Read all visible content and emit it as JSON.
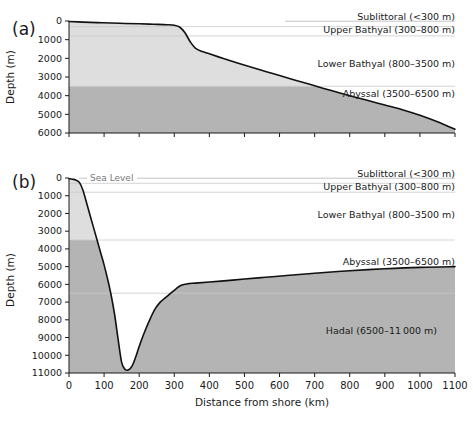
{
  "figure": {
    "axis_titles": {
      "y": "Depth (m)",
      "x": "Distance from shore (km)"
    },
    "sea_level_label": "Sea Level",
    "zones": [
      {
        "name": "sublittoral",
        "label": "Sublittoral (<300 m)",
        "top_m": 0,
        "bottom_m": 300
      },
      {
        "name": "upper-bathyal",
        "label": "Upper Bathyal (300–800 m)",
        "top_m": 300,
        "bottom_m": 800
      },
      {
        "name": "lower-bathyal",
        "label": "Lower Bathyal (800–3500 m)",
        "top_m": 800,
        "bottom_m": 3500
      },
      {
        "name": "abyssal",
        "label": "Abyssal (3500–6500 m)",
        "top_m": 3500,
        "bottom_m": 6500
      },
      {
        "name": "hadal",
        "label": "Hadal (6500–11 000 m)",
        "top_m": 6500,
        "bottom_m": 11000
      }
    ],
    "colors": {
      "shelf_fill_light": "#dedede",
      "deep_fill_dark": "#b4b4b4",
      "profile_line": "#111111",
      "zone_line": "#c9c9c9",
      "axis": "#1a1a1a",
      "sea_level_text": "#7a7a7a"
    }
  },
  "chart_data": [
    {
      "type": "area",
      "panel": "a",
      "panel_label": "(a)",
      "title": "Passive continental margin bathymetric profile",
      "xlabel": "Distance from shore (km)",
      "ylabel": "Depth (m)",
      "xlim": [
        0,
        1100
      ],
      "ylim": [
        6000,
        0
      ],
      "y_inverted": true,
      "xticks": [
        0,
        100,
        200,
        300,
        400,
        500,
        600,
        700,
        800,
        900,
        1000,
        1100
      ],
      "yticks": [
        0,
        1000,
        2000,
        3000,
        4000,
        5000,
        6000
      ],
      "xticklabels": [
        "0",
        "100",
        "200",
        "300",
        "400",
        "500",
        "600",
        "700",
        "800",
        "900",
        "1000",
        "1100"
      ],
      "yticklabels": [
        "0",
        "1000",
        "2000",
        "3000",
        "4000",
        "5000",
        "6000"
      ],
      "grid": false,
      "series": [
        {
          "name": "seafloor depth",
          "x": [
            0,
            40,
            80,
            120,
            160,
            200,
            240,
            280,
            300,
            315,
            330,
            345,
            360,
            380,
            400,
            440,
            480,
            520,
            560,
            600,
            650,
            700,
            750,
            800,
            850,
            900,
            950,
            1000,
            1050,
            1100
          ],
          "values": [
            30,
            60,
            85,
            110,
            130,
            150,
            175,
            200,
            230,
            320,
            620,
            1100,
            1450,
            1640,
            1760,
            2010,
            2250,
            2480,
            2700,
            2920,
            3200,
            3470,
            3740,
            4000,
            4250,
            4500,
            4750,
            5050,
            5400,
            5800
          ]
        }
      ],
      "zone_boundaries_m": [
        300,
        800,
        3500,
        6500
      ],
      "zone_labels": [
        "Sublittoral (<300 m)",
        "Upper Bathyal (300–800 m)",
        "Lower Bathyal (800–3500 m)",
        "Abyssal (3500–6500 m)"
      ]
    },
    {
      "type": "area",
      "panel": "b",
      "panel_label": "(b)",
      "title": "Trench (hadal) bathymetric profile",
      "xlabel": "Distance from shore (km)",
      "ylabel": "Depth (m)",
      "xlim": [
        0,
        1100
      ],
      "ylim": [
        11000,
        0
      ],
      "y_inverted": true,
      "xticks": [
        0,
        100,
        200,
        300,
        400,
        500,
        600,
        700,
        800,
        900,
        1000,
        1100
      ],
      "yticks": [
        0,
        1000,
        2000,
        3000,
        4000,
        5000,
        6000,
        7000,
        8000,
        9000,
        10000,
        11000
      ],
      "xticklabels": [
        "0",
        "100",
        "200",
        "300",
        "400",
        "500",
        "600",
        "700",
        "800",
        "900",
        "1000",
        "1100"
      ],
      "yticklabels": [
        "0",
        "1000",
        "2000",
        "3000",
        "4000",
        "5000",
        "6000",
        "7000",
        "8000",
        "9000",
        "10000",
        "11000"
      ],
      "grid": false,
      "series": [
        {
          "name": "seafloor depth",
          "x": [
            0,
            10,
            20,
            30,
            40,
            50,
            60,
            70,
            80,
            90,
            100,
            110,
            120,
            130,
            140,
            150,
            160,
            170,
            180,
            190,
            200,
            215,
            230,
            245,
            260,
            275,
            290,
            305,
            320,
            340,
            360,
            400,
            450,
            500,
            560,
            620,
            700,
            800,
            900,
            1000,
            1100
          ],
          "values": [
            40,
            70,
            120,
            260,
            700,
            1400,
            2100,
            2800,
            3500,
            4200,
            4900,
            5700,
            6600,
            7700,
            9100,
            10400,
            10800,
            10820,
            10600,
            10100,
            9500,
            8700,
            8000,
            7400,
            7000,
            6750,
            6500,
            6250,
            6050,
            5960,
            5930,
            5870,
            5790,
            5700,
            5600,
            5500,
            5370,
            5230,
            5120,
            5040,
            5000
          ]
        }
      ],
      "zone_boundaries_m": [
        300,
        800,
        3500,
        6500
      ],
      "zone_labels": [
        "Sublittoral (<300 m)",
        "Upper Bathyal (300–800 m)",
        "Lower Bathyal (800–3500 m)",
        "Abyssal (3500–6500 m)",
        "Hadal (6500–11 000 m)"
      ],
      "annotations": [
        {
          "text": "Sea Level",
          "x_km": 55,
          "depth_m": 0
        }
      ]
    }
  ]
}
